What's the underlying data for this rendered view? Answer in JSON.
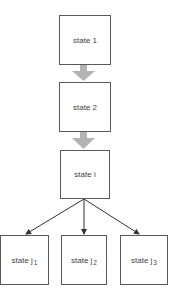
{
  "diagram": {
    "type": "state-flow",
    "colors": {
      "box_border": "#5a5a5a",
      "text": "#444444",
      "thick_arrow": "#b3b3b3",
      "thin_arrow": "#333333"
    },
    "nodes": [
      {
        "id": "s1",
        "label": "state 1",
        "base": "state 1",
        "sub": ""
      },
      {
        "id": "s2",
        "label": "state 2",
        "base": "state 2",
        "sub": ""
      },
      {
        "id": "si",
        "label": "state i",
        "base": "state i",
        "sub": ""
      },
      {
        "id": "sj1",
        "label": "state j1",
        "base": "state j",
        "sub": "1"
      },
      {
        "id": "sj2",
        "label": "state j2",
        "base": "state j",
        "sub": "2"
      },
      {
        "id": "sj3",
        "label": "state j3",
        "base": "state j",
        "sub": "3"
      }
    ],
    "edges": [
      {
        "from": "s1",
        "to": "s2",
        "style": "thick-gray"
      },
      {
        "from": "s2",
        "to": "si",
        "style": "thick-gray"
      },
      {
        "from": "si",
        "to": "sj1",
        "style": "thin-black"
      },
      {
        "from": "si",
        "to": "sj2",
        "style": "thin-black"
      },
      {
        "from": "si",
        "to": "sj3",
        "style": "thin-black"
      }
    ]
  }
}
